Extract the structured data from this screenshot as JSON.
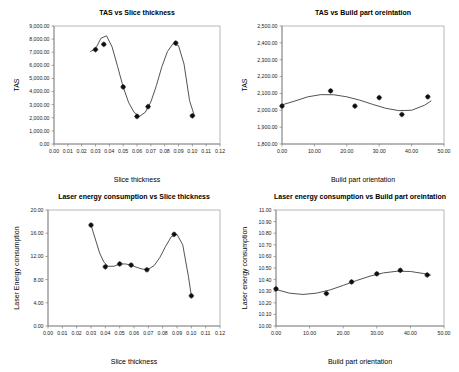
{
  "figure": {
    "background": "#ffffff",
    "line_color": "#3f3f3f",
    "marker_color": "#101010",
    "axis_color": "#808080"
  },
  "chart_data": [
    {
      "id": "tas-vs-slice-thickness",
      "type": "scatter",
      "title": "TAS vs Slice thickness",
      "xlabel": "Slice thickness",
      "ylabel": "TAS",
      "xlim": [
        0,
        0.12
      ],
      "ylim": [
        0,
        9000
      ],
      "grid": false,
      "legend": "none",
      "xticks": [
        0,
        0.01,
        0.02,
        0.03,
        0.04,
        0.05,
        0.06,
        0.07,
        0.08,
        0.09,
        0.1,
        0.11,
        0.12
      ],
      "xticklabels": [
        "0.00",
        "0.01",
        "0.02",
        "0.03",
        "0.04",
        "0.05",
        "0.06",
        "0.07",
        "0.08",
        "0.09",
        "0.10",
        "0.11",
        "0.12"
      ],
      "yticks": [
        0,
        1000,
        2000,
        3000,
        4000,
        5000,
        6000,
        7000,
        8000,
        9000
      ],
      "yticklabels": [
        "0.00",
        "1,000.00",
        "2,000.00",
        "3,000.00",
        "4,000.00",
        "5,000.00",
        "6,000.00",
        "7,000.00",
        "8,000.00",
        "9,000.00"
      ],
      "x": [
        0.03,
        0.036,
        0.05,
        0.06,
        0.068,
        0.088,
        0.1
      ],
      "y": [
        7200,
        7600,
        4350,
        2100,
        2850,
        7700,
        2150
      ],
      "fit_x": [
        0.0265,
        0.03,
        0.034,
        0.038,
        0.042,
        0.046,
        0.05,
        0.054,
        0.058,
        0.062,
        0.066,
        0.07,
        0.074,
        0.078,
        0.082,
        0.086,
        0.09,
        0.094,
        0.098,
        0.1015
      ],
      "fit_y": [
        7060,
        7250,
        8070,
        8250,
        7400,
        5900,
        4350,
        3150,
        2400,
        2120,
        2420,
        3200,
        4450,
        5900,
        7050,
        7650,
        7500,
        6100,
        3300,
        2150
      ]
    },
    {
      "id": "tas-vs-build-part-orientation",
      "type": "scatter",
      "title": "TAS vs Build part oreintation",
      "xlabel": "Build part orientation",
      "ylabel": "TAS",
      "xlim": [
        0,
        50
      ],
      "ylim": [
        1800,
        2500
      ],
      "grid": false,
      "legend": "none",
      "xticks": [
        0,
        10,
        20,
        30,
        40,
        50
      ],
      "xticklabels": [
        "0.00",
        "10.00",
        "20.00",
        "30.00",
        "40.00",
        "50.00"
      ],
      "yticks": [
        1800,
        1900,
        2000,
        2100,
        2200,
        2300,
        2400,
        2500
      ],
      "yticklabels": [
        "1,800.00",
        "1,900.00",
        "2,000.00",
        "2,100.00",
        "2,200.00",
        "2,300.00",
        "2,400.00",
        "2,500.00"
      ],
      "x": [
        0.0,
        15.0,
        22.5,
        30.0,
        37.0,
        45.0
      ],
      "y": [
        2025,
        2115,
        2025,
        2075,
        1975,
        2080
      ],
      "fit_x": [
        0,
        4,
        8,
        12,
        16,
        20,
        24,
        28,
        32,
        36,
        40,
        44,
        46
      ],
      "fit_y": [
        2032,
        2055,
        2080,
        2093,
        2092,
        2080,
        2060,
        2035,
        2012,
        1998,
        2000,
        2030,
        2055
      ]
    },
    {
      "id": "laser-energy-vs-slice-thickness",
      "type": "scatter",
      "title": "Laser energy consumption vs Slice thickness",
      "xlabel": "Slice thickness",
      "ylabel": "Laser Energy consumption",
      "xlim": [
        0,
        0.12
      ],
      "ylim": [
        0,
        20
      ],
      "grid": false,
      "legend": "none",
      "xticks": [
        0,
        0.01,
        0.02,
        0.03,
        0.04,
        0.05,
        0.06,
        0.07,
        0.08,
        0.09,
        0.1,
        0.11,
        0.12
      ],
      "xticklabels": [
        "0.00",
        "0.01",
        "0.02",
        "0.03",
        "0.04",
        "0.05",
        "0.06",
        "0.07",
        "0.08",
        "0.09",
        "0.10",
        "0.11",
        "0.12"
      ],
      "yticks": [
        0,
        4,
        8,
        12,
        16,
        20
      ],
      "yticklabels": [
        "0.00",
        "4.00",
        "8.00",
        "12.00",
        "16.00",
        "20.00"
      ],
      "x": [
        0.03,
        0.04,
        0.05,
        0.058,
        0.069,
        0.088,
        0.1
      ],
      "y": [
        17.4,
        10.2,
        10.7,
        10.5,
        9.7,
        15.8,
        5.2
      ],
      "fit_x": [
        0.03,
        0.033,
        0.036,
        0.039,
        0.042,
        0.046,
        0.05,
        0.054,
        0.058,
        0.062,
        0.066,
        0.07,
        0.074,
        0.078,
        0.082,
        0.086,
        0.09,
        0.094,
        0.098,
        0.1
      ],
      "fit_y": [
        17.4,
        15.0,
        12.6,
        11.0,
        10.3,
        10.3,
        10.7,
        10.7,
        10.5,
        10.1,
        9.8,
        9.8,
        10.4,
        11.8,
        13.7,
        15.4,
        15.8,
        14.0,
        8.5,
        5.2
      ]
    },
    {
      "id": "laser-energy-vs-build-part-orientation",
      "type": "scatter",
      "title": "Laser energy consumption vs Build part oreintation",
      "xlabel": "Build part orientation",
      "ylabel": "Laser energy consumption",
      "xlim": [
        0,
        50
      ],
      "ylim": [
        10.0,
        11.0
      ],
      "grid": false,
      "legend": "none",
      "xticks": [
        0,
        10,
        20,
        30,
        40,
        50
      ],
      "xticklabels": [
        "0.00",
        "10.00",
        "20.00",
        "30.00",
        "40.00",
        "50.00"
      ],
      "yticks": [
        10.0,
        10.1,
        10.2,
        10.3,
        10.4,
        10.5,
        10.6,
        10.7,
        10.8,
        10.9,
        11.0
      ],
      "yticklabels": [
        "10.00",
        "10.10",
        "10.20",
        "10.30",
        "10.40",
        "10.50",
        "10.60",
        "10.70",
        "10.80",
        "10.90",
        "11.00"
      ],
      "x": [
        0.0,
        15.0,
        22.5,
        30.0,
        37.0,
        45.0
      ],
      "y": [
        10.32,
        10.28,
        10.38,
        10.45,
        10.48,
        10.44
      ],
      "fit_x": [
        0,
        4,
        8,
        12,
        16,
        20,
        24,
        28,
        32,
        36,
        40,
        44,
        46
      ],
      "fit_y": [
        10.315,
        10.283,
        10.272,
        10.283,
        10.31,
        10.35,
        10.392,
        10.43,
        10.458,
        10.472,
        10.47,
        10.452,
        10.438
      ]
    }
  ]
}
